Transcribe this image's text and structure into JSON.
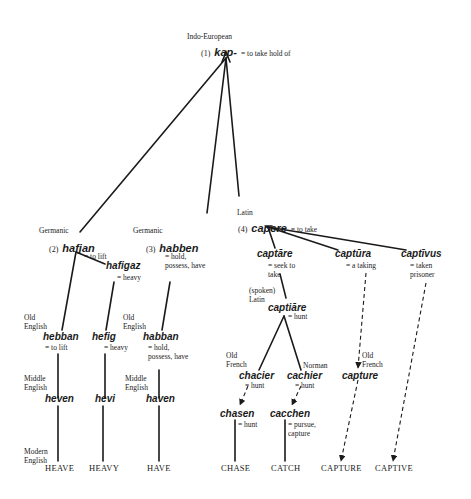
{
  "root": {
    "family": "Indo-European",
    "number": "(1)",
    "word": "kap-",
    "gloss": "= to take hold of"
  },
  "branches": {
    "germanic1": {
      "family": "Germanic",
      "number": "(2)",
      "word": "hafjan",
      "gloss": "= to lift"
    },
    "hafigaz": {
      "word": "hafigaz",
      "gloss": "= heavy"
    },
    "germanic3": {
      "family": "Germanic",
      "number": "(3)",
      "word": "habben",
      "gloss": "= hold, possess, have"
    },
    "latin": {
      "family": "Latin",
      "number": "(4)",
      "word": "capere",
      "gloss": "= to take"
    }
  },
  "oe": {
    "label": "Old English",
    "hebban": {
      "word": "hebban",
      "gloss": "= to lift"
    },
    "hefig": {
      "word": "hefig",
      "gloss": "= heavy"
    },
    "habban": {
      "word": "habban",
      "gloss": "= hold, possess, have"
    }
  },
  "me": {
    "label": "Middle English",
    "heven": "heven",
    "hevi": "hevi",
    "haven": "haven"
  },
  "modern": {
    "label": "Modern English",
    "words": [
      "HEAVE",
      "HEAVY",
      "HAVE",
      "CHASE",
      "CATCH",
      "CAPTURE",
      "CAPTIVE"
    ]
  },
  "latin_children": {
    "captare": {
      "word": "captāre",
      "gloss": "= seek to take"
    },
    "captura": {
      "word": "captūra",
      "gloss": "= a taking"
    },
    "captivus": {
      "word": "captīvus",
      "gloss": "= taken prisoner"
    }
  },
  "spoken_latin": {
    "label": "(spoken) Latin",
    "word": "captiāre",
    "gloss": "= hunt"
  },
  "old_french": {
    "label": "Old French",
    "word": "chacier",
    "gloss": "= hunt"
  },
  "norman": {
    "label": "Norman",
    "word": "cachier",
    "gloss": "= hunt"
  },
  "of_capture": {
    "label": "Old French",
    "word": "capture"
  },
  "me_fr": {
    "chasen": {
      "word": "chasen",
      "gloss": "= hunt"
    },
    "cacchen": {
      "word": "cacchen",
      "gloss": "= pursue, capture"
    }
  },
  "colors": {
    "ink": "#1a1a1a",
    "background": "#ffffff"
  }
}
